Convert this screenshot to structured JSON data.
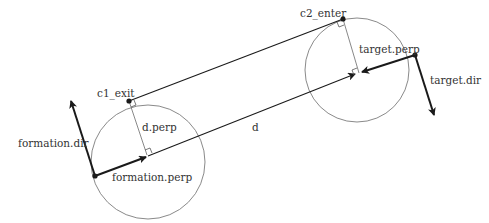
{
  "diagram": {
    "labels": {
      "c1_exit": "c1_exit",
      "c2_enter": "c2_enter",
      "d_perp": "d.perp",
      "d": "d",
      "formation_dir": "formation.dir",
      "formation_perp": "formation.perp",
      "target_perp": "target.perp",
      "target_dir": "target.dir"
    },
    "colors": {
      "circle": "#8a8a8a",
      "line": "#1a1a1a",
      "thin_line": "#7a7a7a",
      "text": "#333333"
    },
    "circles": [
      {
        "name": "formation-circle",
        "cx": 148,
        "cy": 162,
        "r": 57
      },
      {
        "name": "target-circle",
        "cx": 357,
        "cy": 70,
        "r": 52
      }
    ]
  }
}
